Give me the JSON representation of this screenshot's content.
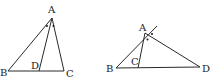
{
  "figures": [
    {
      "id": "left",
      "points": {
        "A": {
          "label": "A",
          "x": 52,
          "y": 18
        },
        "B": {
          "label": "B",
          "x": 8,
          "y": 71
        },
        "C": {
          "label": "C",
          "x": 64,
          "y": 71
        },
        "D": {
          "label": "D",
          "x": 39,
          "y": 71
        }
      },
      "segments": [
        "AB",
        "AC",
        "AD",
        "BC"
      ],
      "angle_marks": "equal angles BAD and DAC marked with dots"
    },
    {
      "id": "right",
      "points": {
        "A": {
          "label": "A",
          "x": 145,
          "y": 33
        },
        "B": {
          "label": "B",
          "x": 116,
          "y": 68
        },
        "C": {
          "label": "C",
          "x": 138,
          "y": 67
        },
        "D": {
          "label": "D",
          "x": 200,
          "y": 67
        }
      },
      "segments": [
        "BA (extended beyond A)",
        "AC",
        "AD",
        "BD"
      ],
      "angle_marks": "equal exterior angles at A marked with dots"
    }
  ],
  "colors": {
    "stroke": "#2a2a2a",
    "label": "#1a1a1a",
    "background": "#ffffff"
  }
}
